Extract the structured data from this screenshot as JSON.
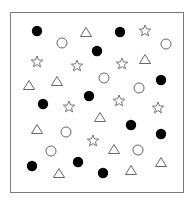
{
  "figure": {
    "frame": {
      "x": 10,
      "y": 12,
      "width": 173,
      "height": 180,
      "stroke": "#7a7a7a"
    },
    "colors": {
      "filled": "#000000",
      "outline": "#555555",
      "background": "#ffffff"
    },
    "shapes": [
      {
        "type": "filled-circle",
        "x": 37,
        "y": 31
      },
      {
        "type": "circle",
        "x": 62,
        "y": 43
      },
      {
        "type": "triangle",
        "x": 86,
        "y": 32
      },
      {
        "type": "filled-circle",
        "x": 120,
        "y": 32
      },
      {
        "type": "star",
        "x": 145,
        "y": 31
      },
      {
        "type": "circle",
        "x": 166,
        "y": 44
      },
      {
        "type": "filled-circle",
        "x": 97,
        "y": 51
      },
      {
        "type": "star",
        "x": 37,
        "y": 62
      },
      {
        "type": "star",
        "x": 77,
        "y": 66
      },
      {
        "type": "star",
        "x": 122,
        "y": 64
      },
      {
        "type": "triangle",
        "x": 145,
        "y": 59
      },
      {
        "type": "filled-circle",
        "x": 161,
        "y": 80
      },
      {
        "type": "circle",
        "x": 104,
        "y": 78
      },
      {
        "type": "circle",
        "x": 139,
        "y": 88
      },
      {
        "type": "triangle",
        "x": 57,
        "y": 81
      },
      {
        "type": "triangle",
        "x": 29,
        "y": 85
      },
      {
        "type": "filled-circle",
        "x": 89,
        "y": 96
      },
      {
        "type": "filled-circle",
        "x": 43,
        "y": 104
      },
      {
        "type": "star",
        "x": 69,
        "y": 107
      },
      {
        "type": "star",
        "x": 119,
        "y": 101
      },
      {
        "type": "star",
        "x": 158,
        "y": 108
      },
      {
        "type": "triangle",
        "x": 100,
        "y": 117
      },
      {
        "type": "filled-circle",
        "x": 131,
        "y": 125
      },
      {
        "type": "triangle",
        "x": 37,
        "y": 129
      },
      {
        "type": "circle",
        "x": 66,
        "y": 132
      },
      {
        "type": "filled-circle",
        "x": 161,
        "y": 134
      },
      {
        "type": "star",
        "x": 93,
        "y": 141
      },
      {
        "type": "triangle",
        "x": 114,
        "y": 149
      },
      {
        "type": "circle",
        "x": 138,
        "y": 150
      },
      {
        "type": "circle",
        "x": 51,
        "y": 151
      },
      {
        "type": "filled-circle",
        "x": 32,
        "y": 166
      },
      {
        "type": "filled-circle",
        "x": 78,
        "y": 162
      },
      {
        "type": "triangle",
        "x": 59,
        "y": 173
      },
      {
        "type": "filled-circle",
        "x": 103,
        "y": 173
      },
      {
        "type": "triangle",
        "x": 131,
        "y": 170
      },
      {
        "type": "triangle",
        "x": 161,
        "y": 162
      }
    ]
  }
}
